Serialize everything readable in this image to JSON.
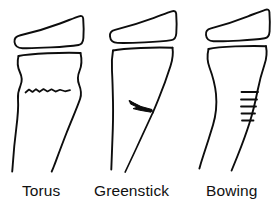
{
  "figure": {
    "background_color": "#ffffff",
    "stroke_color": "#0d0d0d",
    "width": 276,
    "height": 209
  },
  "panels": [
    {
      "id": "torus",
      "label": "Torus",
      "description": "Buckle fracture of the distal metaphysis with cortical bulging and a wavy transverse buckle line",
      "parts": {
        "epiphysis": "wedge-shaped epiphyseal cap",
        "metaphysis": "flared metaphysis with bilateral cortical bulge",
        "fracture": "wavy horizontal buckle line",
        "shaft": "tapering diaphyseal shaft"
      }
    },
    {
      "id": "greenstick",
      "label": "Greenstick",
      "description": "Incomplete fracture with cortical break on the convex side and angulation of the shaft",
      "parts": {
        "epiphysis": "wedge-shaped epiphyseal cap",
        "metaphysis": "flared metaphysis",
        "fracture": "wedge-shaped cortical break with angulated shaft",
        "shaft": "angulated diaphyseal shaft"
      }
    },
    {
      "id": "bowing",
      "label": "Bowing",
      "description": "Plastic deformation of the shaft with no discrete fracture line, marked by microfracture hatch marks",
      "parts": {
        "epiphysis": "wedge-shaped epiphyseal cap",
        "metaphysis": "flared metaphysis",
        "fracture": "five short transverse microfracture hatch marks",
        "shaft": "bowed diaphyseal shaft"
      },
      "hatch_mark_count": 5
    }
  ]
}
